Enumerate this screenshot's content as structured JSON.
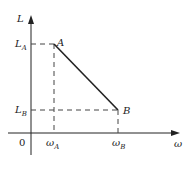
{
  "diagram": {
    "type": "piecewise-line-plot",
    "axes": {
      "y_label": "L",
      "x_label": "ω",
      "origin_label": "0"
    },
    "points": [
      {
        "name": "A",
        "x_label": "ω",
        "x_sub": "A",
        "y_label": "L",
        "y_sub": "A"
      },
      {
        "name": "B",
        "x_label": "ω",
        "x_sub": "B",
        "y_label": "L",
        "y_sub": "B"
      }
    ],
    "colors": {
      "line": "#222222",
      "dashed": "#444444"
    }
  }
}
